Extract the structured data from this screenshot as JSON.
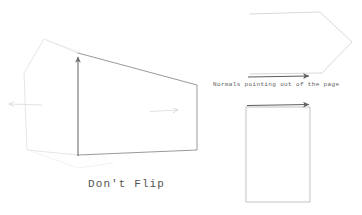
{
  "canvas": {
    "width": 362,
    "height": 215,
    "background": "#ffffff"
  },
  "colors": {
    "dark_stroke": "#6b6b6b",
    "mid_stroke": "#8f8f8f",
    "faint_stroke": "#d8d8d8",
    "very_faint_stroke": "#e6e6e6",
    "text": "#545454",
    "caption_text": "#5c5c5c"
  },
  "labels": {
    "dont_flip": "Don't Flip",
    "normals_caption": "Normals pointing out of the page"
  },
  "shapes": {
    "box_front_face": {
      "name": "front-quadrilateral",
      "points": "78,53 197,85 197,150 78,155",
      "stroke": "#8f8f8f"
    },
    "box_left_face": {
      "name": "left-face-outline",
      "points": "78,53 44,39 24,73 28,150 78,155",
      "stroke": "#e0e0e0"
    },
    "box_bottom_hint": {
      "name": "bottom-edge-hint",
      "points": "28,150 78,168 112,162",
      "stroke": "#ececec"
    },
    "pentagon": {
      "name": "pentagon-outline",
      "points": "250,14 320,12 352,42 322,72 250,74",
      "stroke": "#d2d2d2"
    },
    "rectangle": {
      "name": "rectangle-outline",
      "x": 246,
      "y": 107,
      "width": 64,
      "height": 95,
      "stroke": "#b8b8b8"
    }
  },
  "arrows": {
    "vertical_normal": {
      "name": "upward-normal-arrow",
      "x1": 78,
      "y1": 156,
      "x2": 78,
      "y2": 54,
      "stroke": "#6b6b6b",
      "direction": "up"
    },
    "faint_left": {
      "name": "left-normal-arrow",
      "x1": 42,
      "y1": 105,
      "x2": 6,
      "y2": 104,
      "stroke": "#dcdcdc",
      "direction": "left"
    },
    "faint_right": {
      "name": "right-normal-arrow",
      "x1": 150,
      "y1": 111,
      "x2": 181,
      "y2": 110,
      "stroke": "#dcdcdc",
      "direction": "right"
    },
    "pentagon_arrow": {
      "name": "pentagon-normal-arrow",
      "x1": 248,
      "y1": 77,
      "x2": 312,
      "y2": 76,
      "stroke": "#5e5e5e",
      "direction": "right"
    },
    "rectangle_arrow": {
      "name": "rectangle-normal-arrow",
      "x1": 247,
      "y1": 105,
      "x2": 312,
      "y2": 104,
      "stroke": "#5e5e5e",
      "direction": "right"
    }
  }
}
